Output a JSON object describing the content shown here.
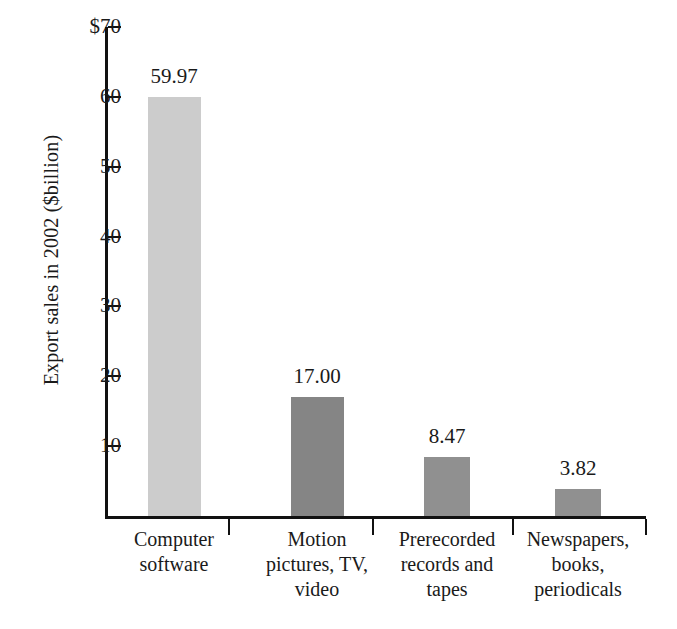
{
  "chart_data": {
    "type": "bar",
    "title": "",
    "subtitle": "",
    "xlabel": "",
    "ylabel": "Export sales in 2002 ($billion)",
    "ylim": [
      0,
      70
    ],
    "ytick_labels": [
      "$70",
      "60",
      "50",
      "40",
      "30",
      "20",
      "10"
    ],
    "ytick_values": [
      70,
      60,
      50,
      40,
      30,
      20,
      10
    ],
    "grid": false,
    "legend": null,
    "categories": [
      "Computer software",
      "Motion pictures, TV, video",
      "Prerecorded records and tapes",
      "Newspapers, books, periodicals"
    ],
    "category_lines": [
      [
        "Computer",
        "software"
      ],
      [
        "Motion",
        "pictures, TV,",
        "video"
      ],
      [
        "Prerecorded",
        "records and",
        "tapes"
      ],
      [
        "Newspapers,",
        "books,",
        "periodicals"
      ]
    ],
    "values": [
      59.97,
      17.0,
      8.47,
      3.82
    ],
    "value_labels": [
      "59.97",
      "17.00",
      "8.47",
      "3.82"
    ],
    "bar_colors": [
      "#cccccc",
      "#858585",
      "#909090",
      "#909090"
    ]
  },
  "axis": {
    "y_title": "Export sales in 2002 ($billion)",
    "ticks": [
      {
        "label": "$70",
        "value": 70
      },
      {
        "label": "60",
        "value": 60
      },
      {
        "label": "50",
        "value": 50
      },
      {
        "label": "40",
        "value": 40
      },
      {
        "label": "30",
        "value": 30
      },
      {
        "label": "20",
        "value": 20
      },
      {
        "label": "10",
        "value": 10
      }
    ]
  },
  "bars": [
    {
      "value_label": "59.97",
      "value": 59.97,
      "color": "#cccccc",
      "lines": [
        "Computer",
        "software"
      ]
    },
    {
      "value_label": "17.00",
      "value": 17.0,
      "color": "#858585",
      "lines": [
        "Motion",
        "pictures, TV,",
        "video"
      ]
    },
    {
      "value_label": "8.47",
      "value": 8.47,
      "color": "#909090",
      "lines": [
        "Prerecorded",
        "records and",
        "tapes"
      ]
    },
    {
      "value_label": "3.82",
      "value": 3.82,
      "color": "#909090",
      "lines": [
        "Newspapers,",
        "books,",
        "periodicals"
      ]
    }
  ]
}
